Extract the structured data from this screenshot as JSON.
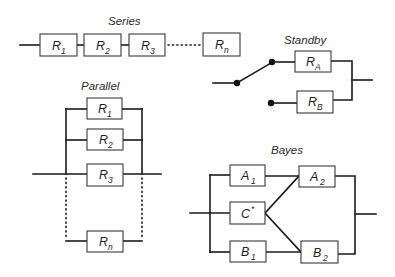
{
  "diagram": {
    "series": {
      "title": "Series",
      "blocks": [
        {
          "main": "R",
          "sub": "1"
        },
        {
          "main": "R",
          "sub": "2"
        },
        {
          "main": "R",
          "sub": "3"
        },
        {
          "main": "R",
          "sub": "n"
        }
      ]
    },
    "standby": {
      "title": "Standby",
      "blocks": [
        {
          "main": "R",
          "sub": "A"
        },
        {
          "main": "R",
          "sub": "B"
        }
      ]
    },
    "parallel": {
      "title": "Parallel",
      "blocks": [
        {
          "main": "R",
          "sub": "1"
        },
        {
          "main": "R",
          "sub": "2"
        },
        {
          "main": "R",
          "sub": "3"
        },
        {
          "main": "R",
          "sub": "n"
        }
      ]
    },
    "bayes": {
      "title": "Bayes",
      "blocks": {
        "a1": {
          "main": "A",
          "sub": "1"
        },
        "c": {
          "main": "C",
          "sup": "*"
        },
        "b1": {
          "main": "B",
          "sub": "1"
        },
        "a2": {
          "main": "A",
          "sub": "2"
        },
        "b2": {
          "main": "B",
          "sub": "2"
        }
      }
    },
    "colors": {
      "line": "#1a1a1a",
      "box_border": "#3a3a3a",
      "background": "#ffffff"
    }
  }
}
